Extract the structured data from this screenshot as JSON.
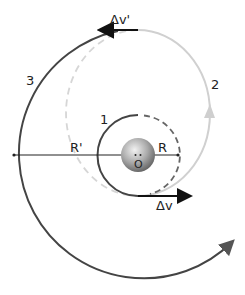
{
  "diagram": {
    "labels": {
      "orbit1": "1",
      "orbit2": "2",
      "orbit3": "3",
      "radius_inner": "R",
      "radius_outer": "R'",
      "center": "O",
      "delta_v_first": "Δv",
      "delta_v_second": "Δv'"
    },
    "colors": {
      "orbit_dark": "#444444",
      "orbit_light": "#d0d0d0",
      "dashed_dark": "#666666",
      "dashed_light": "#d6d6d6",
      "arrow": "#111111",
      "planet_light": "#e8e8e8",
      "planet_dark": "#6a6a6a"
    }
  }
}
